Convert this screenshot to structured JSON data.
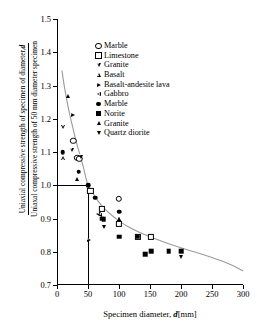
{
  "chart_data": {
    "type": "scatter",
    "title": "",
    "xlabel": "Specimen diameter,  d[mm]",
    "xlabel_parts": {
      "text": "Specimen diameter, ",
      "italic": "d",
      "unit": "[mm]"
    },
    "ylabel_numerator": "Uniaxial compressive strength of specimen of diameter, ",
    "ylabel_numerator_italic": "d",
    "ylabel_denominator": "Uniaxal compressive strength of 50 mm diameter specimen",
    "xlim": [
      0,
      300
    ],
    "ylim": [
      0.7,
      1.5
    ],
    "xticks": [
      0,
      50,
      100,
      150,
      200,
      250,
      300
    ],
    "yticks": [
      0.7,
      0.8,
      0.9,
      1.0,
      1.1,
      1.2,
      1.3,
      1.4,
      1.5
    ],
    "xtick_labels": [
      "0",
      "50",
      "100",
      "150",
      "200",
      "250",
      "300"
    ],
    "ytick_labels": [
      "0.7",
      "0.8",
      "0.9",
      "1.0",
      "1.1",
      "1.2",
      "1.3",
      "1.4",
      "1.5"
    ],
    "grid": false,
    "legend_position": "upper-center",
    "reference_lines": {
      "description": "Normalization reference at 50 mm diameter, ratio 1.0",
      "horizontal_y": 1.0,
      "horizontal_x_end": 50,
      "vertical_x": 50,
      "vertical_y_start": 1.0,
      "vertical_y_end": 0.7,
      "color": "#000000"
    },
    "fit_curve": {
      "name": "Hoek-Brown size effect curve",
      "color": "#9a9a9a",
      "points": [
        [
          8,
          1.345
        ],
        [
          12,
          1.295
        ],
        [
          18,
          1.235
        ],
        [
          24,
          1.185
        ],
        [
          30,
          1.138
        ],
        [
          36,
          1.098
        ],
        [
          42,
          1.058
        ],
        [
          50,
          1.0
        ],
        [
          58,
          0.975
        ],
        [
          66,
          0.953
        ],
        [
          75,
          0.933
        ],
        [
          85,
          0.915
        ],
        [
          100,
          0.893
        ],
        [
          115,
          0.875
        ],
        [
          130,
          0.861
        ],
        [
          150,
          0.845
        ],
        [
          170,
          0.831
        ],
        [
          190,
          0.818
        ],
        [
          215,
          0.803
        ],
        [
          240,
          0.789
        ],
        [
          265,
          0.773
        ],
        [
          285,
          0.757
        ],
        [
          300,
          0.742
        ]
      ]
    },
    "series": [
      {
        "name": "Marble",
        "marker": "circle-open",
        "fill": "open",
        "points": [
          [
            26,
            1.133
          ],
          [
            33,
            1.083
          ],
          [
            36,
            1.08
          ],
          [
            100,
            0.96
          ]
        ]
      },
      {
        "name": "Limestone",
        "marker": "square-open",
        "fill": "open",
        "points": [
          [
            54,
            0.982
          ],
          [
            72,
            0.93
          ],
          [
            100,
            0.884
          ],
          [
            130,
            0.845
          ],
          [
            152,
            0.845
          ]
        ]
      },
      {
        "name": "Granite",
        "marker": "triangle-down-open",
        "fill": "open",
        "points": [
          [
            10,
            1.175
          ],
          [
            24,
            1.105
          ],
          [
            38,
            1.086
          ]
        ]
      },
      {
        "name": "Basalt",
        "marker": "triangle-up-open",
        "fill": "open",
        "points": [
          [
            10,
            1.081
          ],
          [
            70,
            0.916
          ],
          [
            100,
            0.9
          ]
        ]
      },
      {
        "name": "Basalt-andesite lava",
        "marker": "triangle-right-open",
        "fill": "open",
        "points": [
          [
            25,
            1.212
          ],
          [
            52,
            0.836
          ]
        ]
      },
      {
        "name": "Gabbro",
        "marker": "triangle-left-open",
        "fill": "open",
        "points": [
          [
            66,
            0.913
          ],
          [
            69,
            0.912
          ]
        ]
      },
      {
        "name": "Marble",
        "marker": "circle-filled",
        "fill": "filled",
        "points": [
          [
            9,
            1.099
          ],
          [
            35,
            1.041
          ],
          [
            50,
            1.0
          ],
          [
            62,
            0.962
          ],
          [
            100,
            0.92
          ]
        ]
      },
      {
        "name": "Norite",
        "marker": "square-filled",
        "fill": "filled",
        "points": [
          [
            72,
            0.9
          ],
          [
            75,
            0.897
          ],
          [
            100,
            0.845
          ],
          [
            130,
            0.845
          ],
          [
            142,
            0.792
          ],
          [
            152,
            0.801
          ],
          [
            180,
            0.802
          ],
          [
            200,
            0.801
          ]
        ]
      },
      {
        "name": "Granite",
        "marker": "triangle-up-filled",
        "fill": "filled",
        "points": [
          [
            18,
            1.268
          ],
          [
            33,
            1.02
          ],
          [
            100,
            0.9
          ]
        ]
      },
      {
        "name": "Quartz diorite",
        "marker": "triangle-down-filled",
        "fill": "filled",
        "points": [
          [
            76,
            0.873
          ],
          [
            200,
            0.785
          ]
        ]
      }
    ]
  },
  "legend": {
    "entries": [
      {
        "label": "Marble",
        "marker": "circle-open"
      },
      {
        "label": "Limestone",
        "marker": "square-open"
      },
      {
        "label": "Granite",
        "marker": "triangle-down-open"
      },
      {
        "label": "Basalt",
        "marker": "triangle-up-open"
      },
      {
        "label": "Basalt-andesite lava",
        "marker": "triangle-right-open"
      },
      {
        "label": "Gabbro",
        "marker": "triangle-left-open"
      },
      {
        "label": "Marble",
        "marker": "circle-filled"
      },
      {
        "label": "Norite",
        "marker": "square-filled"
      },
      {
        "label": "Granite",
        "marker": "triangle-up-filled"
      },
      {
        "label": "Quartz diorite",
        "marker": "triangle-down-filled"
      }
    ]
  },
  "axis": {
    "x_title_text": "Specimen diameter,",
    "x_title_italic": "d",
    "x_title_unit": "[mm]",
    "y_numerator_text": "Uniaxial compressive strength of specimen of diameter,",
    "y_numerator_italic": "d",
    "y_denominator_text": "Uniaxal compressive strength of 50 mm diameter specimen"
  }
}
